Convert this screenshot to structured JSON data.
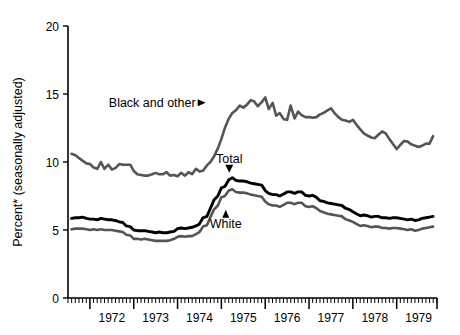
{
  "chart_data": {
    "type": "line",
    "title": "",
    "xlabel": "",
    "ylabel": "Percent* (seasonally adjusted)",
    "ylim": [
      0,
      20
    ],
    "yticks": [
      0,
      5,
      10,
      15,
      20
    ],
    "ytick_labels": [
      "0",
      "5",
      "10",
      "15",
      "20"
    ],
    "xlim": [
      1971.5,
      1979.92
    ],
    "xtick_labels": [
      "1972",
      "1973",
      "1974",
      "1975",
      "1976",
      "1977",
      "1978",
      "1979"
    ],
    "x_major_ticks": [
      1972.0,
      1973.0,
      1974.0,
      1975.0,
      1976.0,
      1977.0,
      1978.0,
      1979.0
    ],
    "x_minor_tick_interval_months": 1,
    "grid": false,
    "legend_position": "inline-annotations",
    "annotations": [
      {
        "label": "Black and other",
        "points_to_series": "Black and other",
        "x": 1974.55,
        "y": 14.35,
        "arrow": "right"
      },
      {
        "label": "Total",
        "points_to_series": "Total",
        "x": 1975.18,
        "y": 9.35,
        "arrow": "down"
      },
      {
        "label": "White",
        "points_to_series": "White",
        "x": 1975.1,
        "y": 6.35,
        "arrow": "up"
      }
    ],
    "series": [
      {
        "name": "Black and other",
        "color": "#555555",
        "width": 2.6,
        "x": [
          1971.58,
          1971.67,
          1971.75,
          1971.83,
          1971.92,
          1972.0,
          1972.08,
          1972.17,
          1972.25,
          1972.33,
          1972.42,
          1972.5,
          1972.58,
          1972.67,
          1972.75,
          1972.83,
          1972.92,
          1973.0,
          1973.08,
          1973.17,
          1973.25,
          1973.33,
          1973.42,
          1973.5,
          1973.58,
          1973.67,
          1973.75,
          1973.83,
          1973.92,
          1974.0,
          1974.08,
          1974.17,
          1974.25,
          1974.33,
          1974.42,
          1974.5,
          1974.58,
          1974.67,
          1974.75,
          1974.83,
          1974.92,
          1975.0,
          1975.08,
          1975.17,
          1975.25,
          1975.33,
          1975.42,
          1975.5,
          1975.58,
          1975.67,
          1975.75,
          1975.83,
          1975.92,
          1976.0,
          1976.08,
          1976.17,
          1976.25,
          1976.33,
          1976.42,
          1976.5,
          1976.58,
          1976.67,
          1976.75,
          1976.83,
          1976.92,
          1977.0,
          1977.08,
          1977.17,
          1977.25,
          1977.33,
          1977.42,
          1977.5,
          1977.58,
          1977.67,
          1977.75,
          1977.83,
          1977.92,
          1978.0,
          1978.08,
          1978.17,
          1978.25,
          1978.33,
          1978.42,
          1978.5,
          1978.58,
          1978.67,
          1978.75,
          1978.83,
          1978.92,
          1979.0,
          1979.08,
          1979.17,
          1979.25,
          1979.33,
          1979.42,
          1979.5,
          1979.58,
          1979.67,
          1979.75,
          1979.83
        ],
        "y": [
          10.6,
          10.5,
          10.3,
          10.1,
          9.9,
          9.85,
          9.6,
          9.5,
          10.0,
          9.5,
          9.8,
          9.45,
          9.55,
          9.85,
          9.8,
          9.8,
          9.8,
          9.35,
          9.1,
          9.05,
          9.0,
          9.0,
          9.1,
          9.2,
          9.1,
          9.1,
          9.25,
          9.0,
          9.05,
          8.95,
          9.2,
          9.0,
          9.25,
          9.1,
          9.5,
          9.3,
          9.35,
          9.75,
          10.0,
          10.4,
          11.0,
          11.7,
          12.5,
          13.2,
          13.6,
          13.8,
          14.15,
          14.0,
          14.2,
          14.55,
          14.45,
          14.1,
          14.4,
          14.75,
          13.9,
          14.35,
          13.4,
          13.6,
          13.15,
          13.1,
          14.15,
          13.2,
          13.7,
          13.45,
          13.3,
          13.3,
          13.25,
          13.3,
          13.5,
          13.6,
          13.8,
          13.95,
          13.6,
          13.3,
          13.1,
          13.05,
          12.95,
          13.1,
          12.75,
          12.4,
          12.1,
          11.95,
          11.8,
          11.75,
          12.0,
          12.25,
          12.1,
          11.7,
          11.3,
          10.95,
          11.25,
          11.55,
          11.5,
          11.3,
          11.2,
          11.1,
          11.2,
          11.35,
          11.35,
          11.9
        ]
      },
      {
        "name": "Total",
        "color": "#000000",
        "width": 2.9,
        "x": [
          1971.58,
          1971.67,
          1971.75,
          1971.83,
          1971.92,
          1972.0,
          1972.08,
          1972.17,
          1972.25,
          1972.33,
          1972.42,
          1972.5,
          1972.58,
          1972.67,
          1972.75,
          1972.83,
          1972.92,
          1973.0,
          1973.08,
          1973.17,
          1973.25,
          1973.33,
          1973.42,
          1973.5,
          1973.58,
          1973.67,
          1973.75,
          1973.83,
          1973.92,
          1974.0,
          1974.08,
          1974.17,
          1974.25,
          1974.33,
          1974.42,
          1974.5,
          1974.58,
          1974.67,
          1974.75,
          1974.83,
          1974.92,
          1975.0,
          1975.08,
          1975.17,
          1975.25,
          1975.33,
          1975.42,
          1975.5,
          1975.58,
          1975.67,
          1975.75,
          1975.83,
          1975.92,
          1976.0,
          1976.08,
          1976.17,
          1976.25,
          1976.33,
          1976.42,
          1976.5,
          1976.58,
          1976.67,
          1976.75,
          1976.83,
          1976.92,
          1977.0,
          1977.08,
          1977.17,
          1977.25,
          1977.33,
          1977.42,
          1977.5,
          1977.58,
          1977.67,
          1977.75,
          1977.83,
          1977.92,
          1978.0,
          1978.08,
          1978.17,
          1978.25,
          1978.33,
          1978.42,
          1978.5,
          1978.58,
          1978.67,
          1978.75,
          1978.83,
          1978.92,
          1979.0,
          1979.08,
          1979.17,
          1979.25,
          1979.33,
          1979.42,
          1979.5,
          1979.58,
          1979.67,
          1979.75,
          1979.83
        ],
        "y": [
          5.85,
          5.9,
          5.9,
          5.95,
          5.85,
          5.8,
          5.8,
          5.75,
          5.85,
          5.8,
          5.75,
          5.75,
          5.7,
          5.6,
          5.55,
          5.3,
          5.25,
          5.0,
          4.95,
          4.95,
          4.95,
          4.9,
          4.85,
          4.8,
          4.85,
          4.8,
          4.8,
          4.85,
          4.9,
          5.1,
          5.15,
          5.1,
          5.15,
          5.2,
          5.3,
          5.45,
          5.9,
          6.0,
          6.6,
          7.2,
          7.5,
          8.1,
          8.2,
          8.7,
          8.85,
          8.65,
          8.6,
          8.6,
          8.55,
          8.45,
          8.4,
          8.35,
          8.3,
          7.9,
          7.7,
          7.6,
          7.6,
          7.5,
          7.65,
          7.8,
          7.8,
          7.7,
          7.8,
          7.8,
          7.55,
          7.5,
          7.55,
          7.4,
          7.15,
          7.1,
          7.0,
          6.95,
          6.9,
          6.85,
          6.8,
          6.6,
          6.5,
          6.35,
          6.2,
          6.05,
          6.1,
          6.05,
          5.95,
          6.0,
          6.0,
          5.9,
          5.9,
          5.85,
          5.9,
          5.9,
          5.85,
          5.8,
          5.75,
          5.8,
          5.7,
          5.75,
          5.85,
          5.9,
          5.95,
          6.0
        ]
      },
      {
        "name": "White",
        "color": "#555555",
        "width": 2.6,
        "x": [
          1971.58,
          1971.67,
          1971.75,
          1971.83,
          1971.92,
          1972.0,
          1972.08,
          1972.17,
          1972.25,
          1972.33,
          1972.42,
          1972.5,
          1972.58,
          1972.67,
          1972.75,
          1972.83,
          1972.92,
          1973.0,
          1973.08,
          1973.17,
          1973.25,
          1973.33,
          1973.42,
          1973.5,
          1973.58,
          1973.67,
          1973.75,
          1973.83,
          1973.92,
          1974.0,
          1974.08,
          1974.17,
          1974.25,
          1974.33,
          1974.42,
          1974.5,
          1974.58,
          1974.67,
          1974.75,
          1974.83,
          1974.92,
          1975.0,
          1975.08,
          1975.17,
          1975.25,
          1975.33,
          1975.42,
          1975.5,
          1975.58,
          1975.67,
          1975.75,
          1975.83,
          1975.92,
          1976.0,
          1976.08,
          1976.17,
          1976.25,
          1976.33,
          1976.42,
          1976.5,
          1976.58,
          1976.67,
          1976.75,
          1976.83,
          1976.92,
          1977.0,
          1977.08,
          1977.17,
          1977.25,
          1977.33,
          1977.42,
          1977.5,
          1977.58,
          1977.67,
          1977.75,
          1977.83,
          1977.92,
          1978.0,
          1978.08,
          1978.17,
          1978.25,
          1978.33,
          1978.42,
          1978.5,
          1978.58,
          1978.67,
          1978.75,
          1978.83,
          1978.92,
          1979.0,
          1979.08,
          1979.17,
          1979.25,
          1979.33,
          1979.42,
          1979.5,
          1979.58,
          1979.67,
          1979.75,
          1979.83
        ],
        "y": [
          5.05,
          5.1,
          5.1,
          5.1,
          5.05,
          5.0,
          5.05,
          5.0,
          5.05,
          5.0,
          5.0,
          5.0,
          4.95,
          4.9,
          4.85,
          4.65,
          4.6,
          4.35,
          4.35,
          4.3,
          4.35,
          4.3,
          4.25,
          4.2,
          4.2,
          4.2,
          4.2,
          4.25,
          4.35,
          4.5,
          4.55,
          4.5,
          4.55,
          4.55,
          4.7,
          4.85,
          5.25,
          5.35,
          5.95,
          6.5,
          6.8,
          7.4,
          7.5,
          7.9,
          8.0,
          7.8,
          7.75,
          7.75,
          7.7,
          7.6,
          7.55,
          7.5,
          7.45,
          7.1,
          6.9,
          6.8,
          6.8,
          6.7,
          6.85,
          7.0,
          7.0,
          6.9,
          7.0,
          7.0,
          6.75,
          6.7,
          6.75,
          6.6,
          6.4,
          6.3,
          6.2,
          6.15,
          6.1,
          6.05,
          6.0,
          5.8,
          5.7,
          5.6,
          5.45,
          5.3,
          5.35,
          5.3,
          5.2,
          5.25,
          5.25,
          5.15,
          5.15,
          5.1,
          5.15,
          5.15,
          5.1,
          5.05,
          5.0,
          5.05,
          4.95,
          5.0,
          5.1,
          5.15,
          5.2,
          5.25
        ]
      }
    ]
  }
}
